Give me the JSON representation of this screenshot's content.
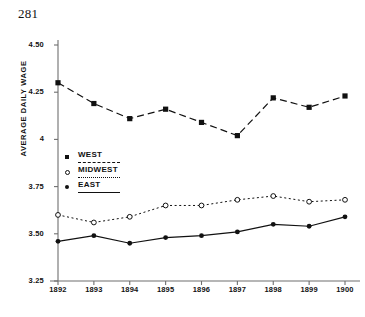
{
  "page": {
    "number": "281"
  },
  "chart_data": {
    "type": "line",
    "title": "",
    "xlabel": "",
    "ylabel": "AVERAGE DAILY WAGE",
    "categories": [
      "1892",
      "1893",
      "1894",
      "1895",
      "1896",
      "1897",
      "1898",
      "1899",
      "1900"
    ],
    "x": [
      1892,
      1893,
      1894,
      1895,
      1896,
      1897,
      1898,
      1899,
      1900
    ],
    "ylim": [
      3.25,
      4.5
    ],
    "yticks": [
      "4.50",
      "4.25",
      "4",
      "3.75",
      "3.50",
      "3.25"
    ],
    "ytick_values": [
      4.5,
      4.25,
      4.0,
      3.75,
      3.5,
      3.25
    ],
    "grid": false,
    "legend_position": "center-left",
    "series": [
      {
        "name": "WEST",
        "marker": "filled-square",
        "linestyle": "dashed",
        "color": "#111111",
        "values": [
          4.3,
          4.19,
          4.11,
          4.16,
          4.09,
          4.02,
          4.22,
          4.17,
          4.23
        ]
      },
      {
        "name": "MIDWEST",
        "marker": "open-circle",
        "linestyle": "dotted",
        "color": "#111111",
        "values": [
          3.6,
          3.56,
          3.59,
          3.65,
          3.65,
          3.68,
          3.7,
          3.67,
          3.68
        ]
      },
      {
        "name": "EAST",
        "marker": "filled-circle",
        "linestyle": "solid",
        "color": "#111111",
        "values": [
          3.46,
          3.49,
          3.45,
          3.48,
          3.49,
          3.51,
          3.55,
          3.54,
          3.59
        ]
      }
    ]
  }
}
